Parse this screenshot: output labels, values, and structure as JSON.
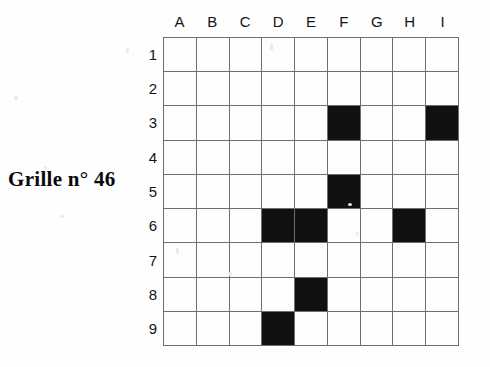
{
  "title": "Grille n° 46",
  "grid": {
    "column_headers": [
      "A",
      "B",
      "C",
      "D",
      "E",
      "F",
      "G",
      "H",
      "I"
    ],
    "row_headers": [
      "1",
      "2",
      "3",
      "4",
      "5",
      "6",
      "7",
      "8",
      "9"
    ],
    "rows": 9,
    "columns": 9,
    "cell_color_empty": "#fdfdfd",
    "cell_color_filled": "#111111",
    "grid_line_color": "#6e6e6e",
    "filled_cells": [
      "F3",
      "I3",
      "F5",
      "D6",
      "E6",
      "H6",
      "E8",
      "D9"
    ],
    "cells": [
      [
        "",
        "",
        "",
        "",
        "",
        "",
        "",
        "",
        ""
      ],
      [
        "",
        "",
        "",
        "",
        "",
        "",
        "",
        "",
        ""
      ],
      [
        "",
        "",
        "",
        "",
        "",
        "filled",
        "",
        "",
        "filled"
      ],
      [
        "",
        "",
        "",
        "",
        "",
        "",
        "",
        "",
        ""
      ],
      [
        "",
        "",
        "",
        "",
        "",
        "filled",
        "",
        "",
        ""
      ],
      [
        "",
        "",
        "",
        "filled",
        "filled",
        "",
        "",
        "filled",
        ""
      ],
      [
        "",
        "",
        "",
        "",
        "",
        "",
        "",
        "",
        ""
      ],
      [
        "",
        "",
        "",
        "",
        "filled",
        "",
        "",
        "",
        ""
      ],
      [
        "",
        "",
        "",
        "filled",
        "",
        "",
        "",
        "",
        ""
      ]
    ]
  }
}
